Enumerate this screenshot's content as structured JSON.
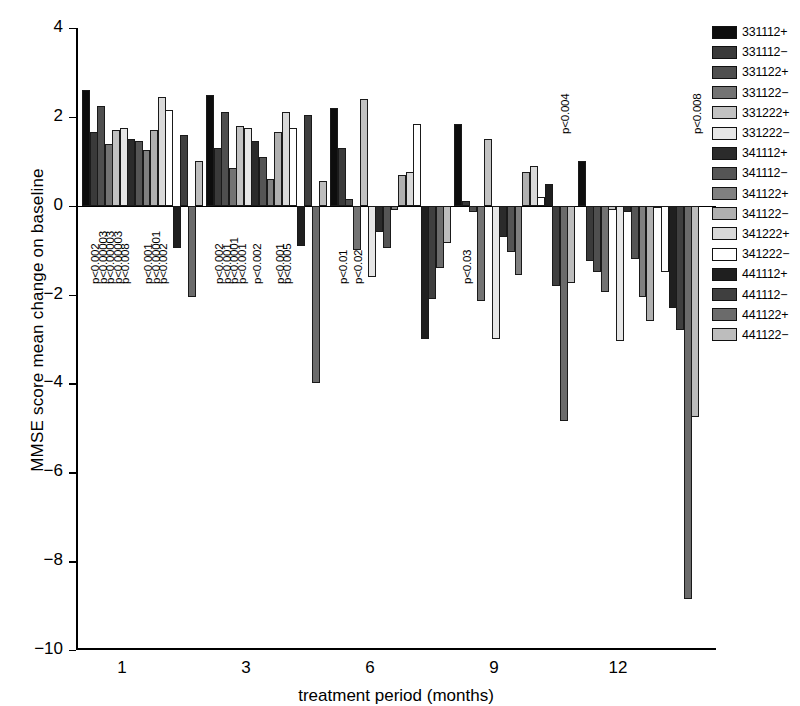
{
  "chart_data": {
    "type": "bar",
    "title": "",
    "xlabel": "treatment period (months)",
    "ylabel": "MMSE score mean change on baseline",
    "categories": [
      "1",
      "3",
      "6",
      "9",
      "12"
    ],
    "xticks": [
      "1",
      "3",
      "6",
      "9",
      "12"
    ],
    "yticks": [
      "4",
      "2",
      "0",
      "-2",
      "-4",
      "-6",
      "-8",
      "-10"
    ],
    "ytick_values": [
      4,
      2,
      0,
      -2,
      -4,
      -6,
      -8,
      -10
    ],
    "ylim": [
      -10,
      4
    ],
    "grid": false,
    "legend_position": "right",
    "series": [
      {
        "name": "331112+",
        "color": "#0d0d0d",
        "values": [
          2.6,
          2.5,
          2.2,
          1.85,
          1.0
        ]
      },
      {
        "name": "331112−",
        "color": "#3a3a3a",
        "values": [
          1.65,
          1.3,
          1.3,
          0.1,
          -1.25
        ]
      },
      {
        "name": "331122+",
        "color": "#4f4f4f",
        "values": [
          2.25,
          2.1,
          0.15,
          -0.15,
          -1.5
        ]
      },
      {
        "name": "331122−",
        "color": "#737373",
        "values": [
          1.4,
          0.85,
          -1.0,
          -2.15,
          -1.95
        ]
      },
      {
        "name": "331222+",
        "color": "#c2c2c2",
        "values": [
          1.7,
          1.8,
          2.4,
          1.5,
          -0.1
        ]
      },
      {
        "name": "331222−",
        "color": "#e6e6e6",
        "values": [
          1.75,
          1.75,
          -1.6,
          -3.0,
          -3.05
        ]
      },
      {
        "name": "341112+",
        "color": "#2b2b2b",
        "values": [
          1.5,
          1.45,
          -0.6,
          -0.7,
          -0.15
        ]
      },
      {
        "name": "341112−",
        "color": "#555555",
        "values": [
          1.45,
          1.1,
          -0.95,
          -1.05,
          -1.2
        ]
      },
      {
        "name": "341122+",
        "color": "#808080",
        "values": [
          1.25,
          0.6,
          -0.1,
          -1.55,
          -2.05
        ]
      },
      {
        "name": "341122−",
        "color": "#b0b0b0",
        "values": [
          1.7,
          1.65,
          0.7,
          0.75,
          -2.6
        ]
      },
      {
        "name": "341222+",
        "color": "#d9d9d9",
        "values": [
          2.45,
          2.1,
          0.75,
          0.9,
          -0.05
        ]
      },
      {
        "name": "341222−",
        "color": "#ffffff",
        "values": [
          2.15,
          1.75,
          1.85,
          0.2,
          -1.5
        ]
      },
      {
        "name": "441112+",
        "color": "#1f1f1f",
        "values": [
          -0.95,
          -0.9,
          -3.0,
          0.5,
          -2.3
        ]
      },
      {
        "name": "441112−",
        "color": "#3f3f3f",
        "values": [
          1.6,
          2.05,
          -2.1,
          -1.8,
          -2.8
        ]
      },
      {
        "name": "441122+",
        "color": "#6b6b6b",
        "values": [
          -2.05,
          -4.0,
          -1.4,
          -4.85,
          -8.85
        ]
      },
      {
        "name": "441122−",
        "color": "#bdbdbd",
        "values": [
          1.0,
          0.55,
          -0.85,
          -1.75,
          -4.75
        ]
      }
    ],
    "annotations": [
      {
        "text": "p<0.002",
        "group": 0,
        "series": 0
      },
      {
        "text": "p<0.00003",
        "group": 0,
        "series": 1
      },
      {
        "text": "p<0.00003",
        "group": 0,
        "series": 2
      },
      {
        "text": "p<0.00003",
        "group": 0,
        "series": 3
      },
      {
        "text": "p<0.008",
        "group": 0,
        "series": 4
      },
      {
        "text": "p<0.001",
        "group": 0,
        "series": 7
      },
      {
        "text": "p<0.00001",
        "group": 0,
        "series": 8
      },
      {
        "text": "p<0.002",
        "group": 0,
        "series": 9
      },
      {
        "text": "p<0.002",
        "group": 1,
        "series": 0
      },
      {
        "text": "p<0.001",
        "group": 1,
        "series": 1
      },
      {
        "text": "p<0.0001",
        "group": 1,
        "series": 2
      },
      {
        "text": "p<0.001",
        "group": 1,
        "series": 3
      },
      {
        "text": "p<0.002",
        "group": 1,
        "series": 5
      },
      {
        "text": "p<0.001",
        "group": 1,
        "series": 8
      },
      {
        "text": "p<0.005",
        "group": 1,
        "series": 9
      },
      {
        "text": "p<0.01",
        "group": 2,
        "series": 0
      },
      {
        "text": "p<0.02",
        "group": 2,
        "series": 2
      },
      {
        "text": "p<0.03",
        "group": 3,
        "series": 0
      },
      {
        "text": "p<0.004",
        "group": 3,
        "series": 13
      },
      {
        "text": "p<0.008",
        "group": 4,
        "series": 14
      }
    ]
  },
  "legend": {
    "items": [
      {
        "label": "331112+",
        "color": "#0d0d0d"
      },
      {
        "label": "331112−",
        "color": "#3a3a3a"
      },
      {
        "label": "331122+",
        "color": "#4f4f4f"
      },
      {
        "label": "331122−",
        "color": "#737373"
      },
      {
        "label": "331222+",
        "color": "#c2c2c2"
      },
      {
        "label": "331222−",
        "color": "#e6e6e6"
      },
      {
        "label": "341112+",
        "color": "#2b2b2b"
      },
      {
        "label": "341112−",
        "color": "#555555"
      },
      {
        "label": "341122+",
        "color": "#808080"
      },
      {
        "label": "341122−",
        "color": "#b0b0b0"
      },
      {
        "label": "341222+",
        "color": "#d9d9d9"
      },
      {
        "label": "341222−",
        "color": "#ffffff"
      },
      {
        "label": "441112+",
        "color": "#1f1f1f"
      },
      {
        "label": "441112−",
        "color": "#3f3f3f"
      },
      {
        "label": "441122+",
        "color": "#6b6b6b"
      },
      {
        "label": "441122−",
        "color": "#bdbdbd"
      }
    ]
  }
}
